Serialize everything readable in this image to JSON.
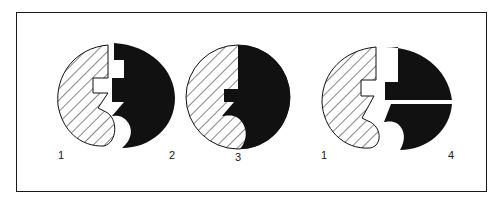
{
  "diagram": {
    "colors": {
      "ink": "#111111",
      "paper": "#ffffff",
      "frame": "#1a1a1a"
    },
    "figures": [
      {
        "id": "separated",
        "labels": [
          "1",
          "2"
        ],
        "parts": [
          "hatched-piece",
          "solid-piece"
        ]
      },
      {
        "id": "joined",
        "labels": [
          "3"
        ],
        "parts": [
          "hatched-piece",
          "solid-piece"
        ]
      },
      {
        "id": "split",
        "labels": [
          "1",
          "4"
        ],
        "parts": [
          "hatched-piece",
          "solid-piece-upper",
          "solid-piece-lower"
        ]
      }
    ],
    "labels": {
      "fig1_left": "1",
      "fig1_right": "2",
      "fig2_center": "3",
      "fig3_left": "1",
      "fig3_right": "4"
    }
  }
}
